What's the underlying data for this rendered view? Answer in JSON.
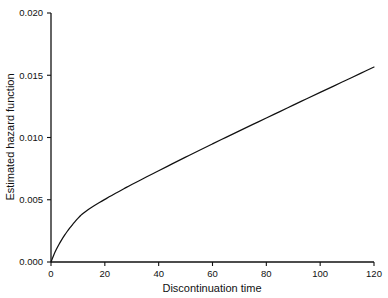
{
  "chart_data": {
    "type": "line",
    "title": "",
    "xlabel": "Discontinuation time",
    "ylabel": "Estimated hazard function",
    "xlim": [
      0,
      120
    ],
    "ylim": [
      0.0,
      0.02
    ],
    "grid": false,
    "legend": null,
    "xticks": [
      0,
      20,
      40,
      60,
      80,
      100,
      120
    ],
    "xtick_labels": [
      "0",
      "20",
      "40",
      "60",
      "80",
      "100",
      "120"
    ],
    "yticks": [
      0.0,
      0.005,
      0.01,
      0.015,
      0.02
    ],
    "ytick_labels": [
      "0.000",
      "0.005",
      "0.010",
      "0.015",
      "0.020"
    ],
    "series": [
      {
        "name": "Estimated hazard function",
        "color": "#111111",
        "x": [
          0,
          1,
          2,
          3,
          4,
          5,
          6,
          7,
          8,
          9,
          10,
          11,
          12,
          14,
          16,
          18,
          20,
          24,
          28,
          30,
          34,
          38,
          40,
          45,
          50,
          55,
          60,
          65,
          70,
          75,
          80,
          85,
          90,
          95,
          100,
          105,
          110,
          115,
          120
        ],
        "y": [
          0.0,
          0.00055,
          0.00102,
          0.00143,
          0.0018,
          0.00214,
          0.00245,
          0.00274,
          0.00301,
          0.00326,
          0.0035,
          0.00373,
          0.00392,
          0.00424,
          0.00452,
          0.00478,
          0.00503,
          0.00552,
          0.00599,
          0.00622,
          0.00667,
          0.00711,
          0.00733,
          0.00788,
          0.00842,
          0.00896,
          0.00949,
          0.01001,
          0.01053,
          0.01105,
          0.01157,
          0.01208,
          0.0126,
          0.01311,
          0.01362,
          0.01413,
          0.01464,
          0.01515,
          0.01566
        ]
      }
    ],
    "annotations": []
  },
  "axis": {
    "x_title": "Discontinuation time",
    "y_title": "Estimated hazard function"
  }
}
